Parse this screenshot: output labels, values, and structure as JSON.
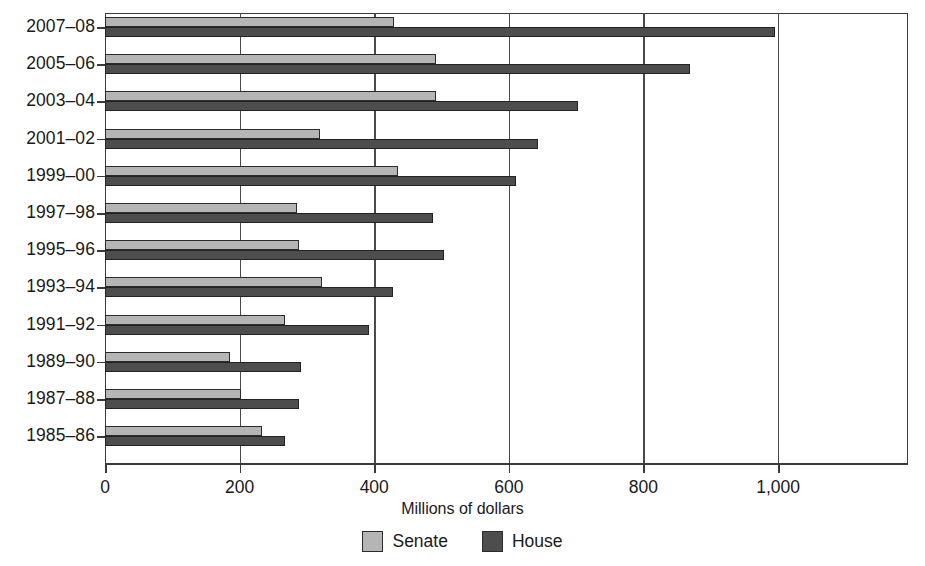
{
  "chart_data": {
    "type": "bar",
    "orientation": "horizontal",
    "title": "",
    "xlabel": "Millions of dollars",
    "ylabel": "",
    "xlim": [
      0,
      1193
    ],
    "xticks": [
      0,
      200,
      400,
      600,
      800,
      1000
    ],
    "xticklabels": [
      "0",
      "200",
      "400",
      "600",
      "800",
      "1,000"
    ],
    "grid": "vertical",
    "legend_position": "bottom-center",
    "categories": [
      "2007–08",
      "2005–06",
      "2003–04",
      "2001–02",
      "1999–00",
      "1997–98",
      "1995–96",
      "1993–94",
      "1991–92",
      "1989–90",
      "1987–88",
      "1985–86"
    ],
    "series": [
      {
        "name": "Senate",
        "color": "#b5b5b5",
        "values": [
          430,
          492,
          492,
          320,
          435,
          285,
          288,
          322,
          267,
          186,
          202,
          233
        ]
      },
      {
        "name": "House",
        "color": "#4d4d4d",
        "values": [
          995,
          869,
          703,
          643,
          611,
          487,
          504,
          428,
          392,
          291,
          288,
          267
        ]
      }
    ]
  },
  "legend": {
    "items": [
      {
        "label": "Senate",
        "color": "#b5b5b5"
      },
      {
        "label": "House",
        "color": "#4d4d4d"
      }
    ]
  },
  "axis": {
    "x_title": "Millions of dollars"
  }
}
